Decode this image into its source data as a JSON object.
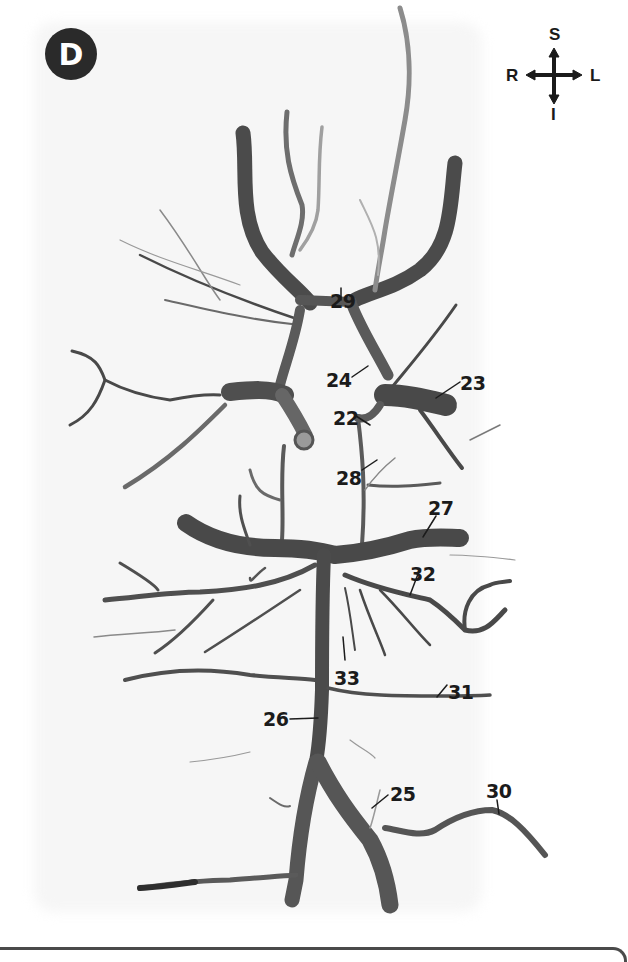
{
  "figure": {
    "panel_letter": "D",
    "colors": {
      "badge_bg": "#2a2a2a",
      "badge_text": "#ffffff",
      "vessel": "#5a5a5a",
      "vessel_dark": "#3e3e3e",
      "label_text": "#1b1b1b",
      "frame": "#4a4a4a"
    }
  },
  "compass": {
    "icon": "orientation-compass-icon",
    "top": "S",
    "bottom": "I",
    "left": "R",
    "right": "L"
  },
  "labels": [
    {
      "id": "29",
      "text": "29"
    },
    {
      "id": "24",
      "text": "24"
    },
    {
      "id": "23",
      "text": "23"
    },
    {
      "id": "22",
      "text": "22"
    },
    {
      "id": "28",
      "text": "28"
    },
    {
      "id": "27",
      "text": "27"
    },
    {
      "id": "32",
      "text": "32"
    },
    {
      "id": "33",
      "text": "33"
    },
    {
      "id": "31",
      "text": "31"
    },
    {
      "id": "26",
      "text": "26"
    },
    {
      "id": "25",
      "text": "25"
    },
    {
      "id": "30",
      "text": "30"
    }
  ]
}
